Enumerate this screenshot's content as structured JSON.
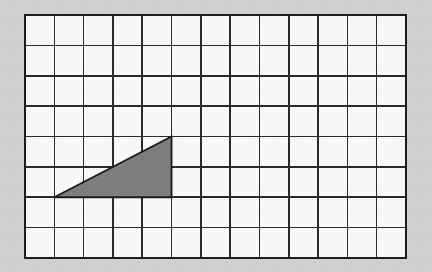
{
  "figure": {
    "background_color": "#d2d2d2",
    "canvas": {
      "width": 432,
      "height": 272
    }
  },
  "grid": {
    "name": "square-grid",
    "columns": 13,
    "rows": 8,
    "cell_width": 29.3,
    "cell_height": 30.4,
    "origin_x": 25,
    "origin_y": 15,
    "width": 381,
    "height": 243,
    "cell_fill_color": "#fafafa",
    "line_color": "#2b2b2b",
    "line_width": 1.6,
    "border_color": "#1e1e1e",
    "border_width": 2.6,
    "grid_visible": true
  },
  "chart_data": {
    "type": "scatter",
    "xlabel": "",
    "ylabel": "",
    "xlim": [
      0,
      13
    ],
    "ylim": [
      0,
      8
    ],
    "grid": true,
    "legend": "none",
    "annotations": [],
    "shapes": [
      {
        "name": "shaded-triangle",
        "kind": "polygon",
        "shape": "right triangle",
        "fill_color": "#7f7f7f",
        "stroke_color": "#1a1a1a",
        "stroke_width": 1.8,
        "vertices_grid": [
          [
            1,
            2
          ],
          [
            5,
            2
          ],
          [
            5,
            4
          ]
        ],
        "vertices_px": [
          [
            54.3,
            197.8
          ],
          [
            171.5,
            197.8
          ],
          [
            171.5,
            137.0
          ]
        ],
        "base_cells": 4,
        "height_cells": 2,
        "area_cells": 4,
        "right_angle_at_grid": [
          5,
          2
        ]
      }
    ]
  },
  "triangle": {
    "name": "shaded-triangle",
    "fill_color": "#7f7f7f",
    "stroke_color": "#1a1a1a",
    "base_cells": 4,
    "height_cells": 2,
    "area_cells": 4
  }
}
